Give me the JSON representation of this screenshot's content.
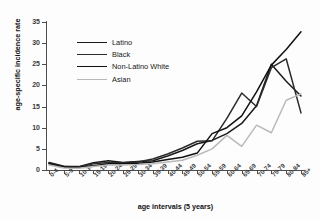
{
  "chart_data": {
    "type": "line",
    "title": "",
    "xlabel": "age intervals (5 years)",
    "ylabel": "age-specific incidence rate",
    "ylim": [
      0,
      35
    ],
    "yticks": [
      0,
      5,
      10,
      15,
      20,
      25,
      30,
      35
    ],
    "grid": false,
    "legend_position": "upper-left-inside",
    "categories": [
      "0-4",
      "5-9",
      "10-14",
      "15-19",
      "20-24",
      "25-29",
      "30-34",
      "35-39",
      "40-44",
      "45-49",
      "50-54",
      "55-59",
      "60-64",
      "65-69",
      "70-74",
      "75-79",
      "80-84",
      "85+"
    ],
    "series": [
      {
        "name": "Latino",
        "color": "#1a1a1a",
        "values": [
          1.8,
          0.9,
          0.8,
          1.7,
          2.2,
          1.8,
          2.0,
          2.2,
          3.3,
          4.6,
          6.2,
          7.0,
          8.6,
          11.0,
          15.2,
          25.0,
          21.0,
          17.5
        ]
      },
      {
        "name": "Black",
        "color": "#2b2b2b",
        "values": [
          1.6,
          0.8,
          0.7,
          1.5,
          1.8,
          1.7,
          1.9,
          2.6,
          3.8,
          5.2,
          6.8,
          6.9,
          12.2,
          18.2,
          15.0,
          24.2,
          26.3,
          13.5
        ]
      },
      {
        "name": "Non-Latino White",
        "color": "#111111",
        "values": [
          1.5,
          0.7,
          0.6,
          1.0,
          1.5,
          1.5,
          1.6,
          1.9,
          2.5,
          3.0,
          4.0,
          8.6,
          10.0,
          12.8,
          18.5,
          24.8,
          28.5,
          32.7
        ]
      },
      {
        "name": "Asian",
        "color": "#b9b9b9",
        "values": [
          1.2,
          0.5,
          0.4,
          0.8,
          1.2,
          1.2,
          1.3,
          1.5,
          1.9,
          2.3,
          3.5,
          5.0,
          8.2,
          5.6,
          10.6,
          8.8,
          16.5,
          18.0
        ]
      }
    ]
  },
  "legend": {
    "items": [
      {
        "label": "Latino"
      },
      {
        "label": "Black"
      },
      {
        "label": "Non-Latino White"
      },
      {
        "label": "Asian"
      }
    ]
  }
}
